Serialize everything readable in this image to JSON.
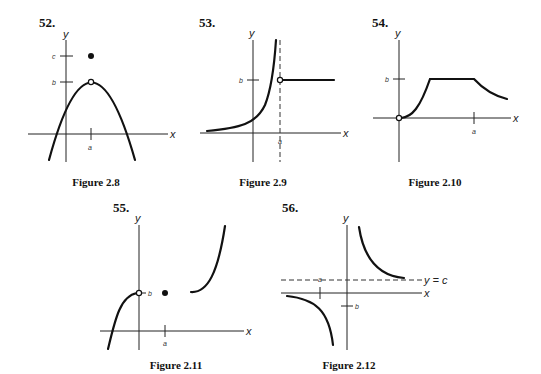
{
  "figures": [
    {
      "problem_number": "52.",
      "caption": "Figure 2.8",
      "x_axis_label": "x",
      "y_axis_label": "y",
      "y_tick_labels": [
        "c",
        "b"
      ],
      "x_tick_labels": [
        "a"
      ],
      "description": "Downward parabola with vertex at (a, b) shown as open circle; filled dot at (a, c) above"
    },
    {
      "problem_number": "53.",
      "caption": "Figure 2.9",
      "x_axis_label": "x",
      "y_axis_label": "y",
      "y_tick_labels": [
        "b"
      ],
      "x_tick_labels": [
        "a"
      ],
      "description": "Curve increasing to vertical asymptote x = a (dashed); open circle at (a, b) with horizontal line y = b for x > a"
    },
    {
      "problem_number": "54.",
      "caption": "Figure 2.10",
      "x_axis_label": "x",
      "y_axis_label": "y",
      "y_tick_labels": [
        "b"
      ],
      "x_tick_labels": [
        "a"
      ],
      "description": "Open circle at origin; curve rises to plateau at y = b, stays flat until x = a, then decreases"
    },
    {
      "problem_number": "55.",
      "caption": "Figure 2.11",
      "x_axis_label": "x",
      "y_axis_label": "y",
      "y_tick_labels": [
        "b"
      ],
      "x_tick_labels": [
        "a"
      ],
      "description": "Cubic-like curve rising to open circle at (0, b); filled dot at (a, b); separate curve increasing steeply to the right"
    },
    {
      "problem_number": "56.",
      "caption": "Figure 2.12",
      "x_axis_label": "x",
      "y_axis_label": "y",
      "y_tick_labels": [
        "b"
      ],
      "x_tick_labels": [
        "a"
      ],
      "asymptote_label": "y = c",
      "description": "Hyperbola-like branches with horizontal dashed asymptote y = c; upper-right branch decreasing toward y = c, lower-left branch decreasing to -infinity"
    }
  ]
}
